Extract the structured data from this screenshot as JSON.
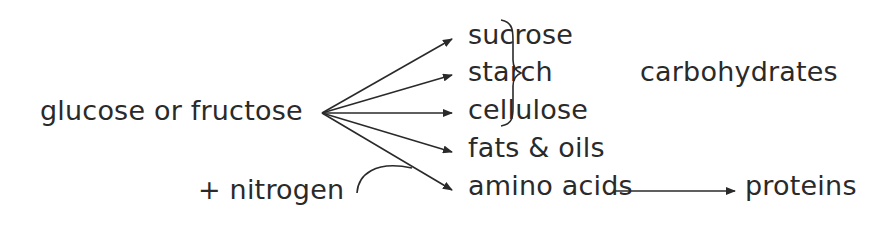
{
  "diagram": {
    "source": "glucose or fructose",
    "additive": "+  nitrogen",
    "products": [
      {
        "label": "sucrose"
      },
      {
        "label": "starch"
      },
      {
        "label": "cellulose"
      },
      {
        "label": "fats & oils"
      },
      {
        "label": "amino acids"
      }
    ],
    "group_label": "carbohydrates",
    "final_product": "proteins",
    "colors": {
      "ink": "#2a2a2a",
      "background": "#ffffff"
    }
  }
}
